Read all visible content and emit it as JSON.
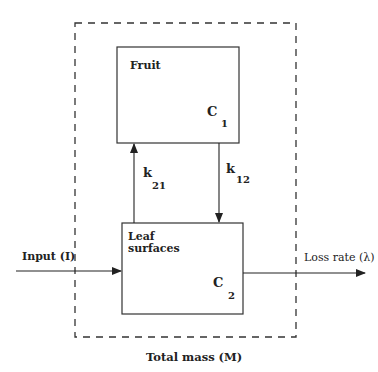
{
  "diagram": {
    "boundary": {
      "label": "Total mass  (M)"
    },
    "compartments": [
      {
        "id": "fruit",
        "label": "Fruit",
        "symbol": "C",
        "index": "1"
      },
      {
        "id": "leaf",
        "label_line1": "Leaf",
        "label_line2": "surfaces",
        "symbol": "C",
        "index": "2"
      }
    ],
    "flows": {
      "k21": {
        "symbol": "k",
        "index": "21",
        "from": "leaf",
        "to": "fruit"
      },
      "k12": {
        "symbol": "k",
        "index": "12",
        "from": "fruit",
        "to": "leaf"
      },
      "input": {
        "label": "Input (I)",
        "to": "leaf"
      },
      "loss": {
        "label": "Loss rate (λ)",
        "from": "leaf"
      }
    }
  }
}
